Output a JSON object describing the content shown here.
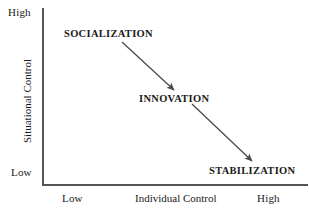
{
  "diagram": {
    "title": "",
    "y_axis": {
      "title": "Situational Control",
      "high_label": "High",
      "low_label": "Low"
    },
    "x_axis": {
      "title": "Individual Control",
      "low_label": "Low",
      "high_label": "High"
    },
    "stages": [
      {
        "id": "socialization",
        "label": "SOCIALIZATION"
      },
      {
        "id": "innovation",
        "label": "INNOVATION"
      },
      {
        "id": "stabilization",
        "label": "STABILIZATION"
      }
    ],
    "arrows": [
      {
        "from": "socialization",
        "to": "innovation"
      },
      {
        "from": "innovation",
        "to": "stabilization"
      }
    ],
    "colors": {
      "axis": "#555555",
      "text": "#1a1a1a",
      "arrow": "#4a4a4a",
      "background": "#ffffff"
    }
  }
}
